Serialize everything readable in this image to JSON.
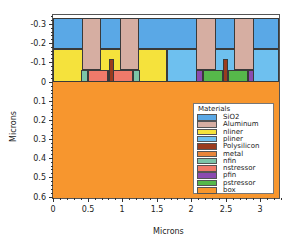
{
  "chart_data": {
    "type": "table",
    "title": "",
    "xlabel": "Microns",
    "ylabel": "Microns",
    "xlim": [
      0,
      3.27
    ],
    "ylim": [
      -0.35,
      0.6
    ],
    "y_inverted": true,
    "x_ticks": [
      "0",
      "0.5",
      "1",
      "1.5",
      "2",
      "2.5",
      "3"
    ],
    "y_ticks": [
      "-0.3",
      "-0.2",
      "-0.1",
      "0",
      "0.1",
      "0.2",
      "0.3",
      "0.4",
      "0.5",
      "0.6"
    ],
    "legend_title": "Materials",
    "legend_position": "lower right",
    "materials": [
      {
        "name": "SiO2",
        "color": "#5aa8e6"
      },
      {
        "name": "Aluminum",
        "color": "#d6aea2"
      },
      {
        "name": "nliner",
        "color": "#f5e23c"
      },
      {
        "name": "pliner",
        "color": "#6ec0ef"
      },
      {
        "name": "Polysilicon",
        "color": "#9a3b1e"
      },
      {
        "name": "metal",
        "color": "#e8853a"
      },
      {
        "name": "nfin",
        "color": "#7cc4a8"
      },
      {
        "name": "nstressor",
        "color": "#f07a6a"
      },
      {
        "name": "pfin",
        "color": "#8b4bb0"
      },
      {
        "name": "pstressor",
        "color": "#56b84a"
      },
      {
        "name": "box",
        "color": "#f7962e"
      }
    ],
    "regions": [
      {
        "material": "box",
        "x": [
          0,
          3.27
        ],
        "y": [
          0,
          0.6
        ]
      },
      {
        "material": "SiO2",
        "x": [
          0,
          3.27
        ],
        "y": [
          -0.33,
          -0.17
        ]
      },
      {
        "material": "nliner",
        "x": [
          0,
          1.65
        ],
        "y": [
          -0.17,
          0
        ]
      },
      {
        "material": "pliner",
        "x": [
          1.65,
          3.27
        ],
        "y": [
          -0.17,
          0
        ]
      },
      {
        "material": "Aluminum",
        "x": [
          0.42,
          0.7
        ],
        "y": [
          -0.33,
          -0.06
        ]
      },
      {
        "material": "Aluminum",
        "x": [
          0.97,
          1.25
        ],
        "y": [
          -0.33,
          -0.06
        ]
      },
      {
        "material": "nfin",
        "x": [
          0.41,
          0.51
        ],
        "y": [
          -0.06,
          0
        ]
      },
      {
        "material": "nstressor",
        "x": [
          0.51,
          0.8
        ],
        "y": [
          -0.06,
          0
        ]
      },
      {
        "material": "nfin",
        "x": [
          0.8,
          0.87
        ],
        "y": [
          -0.06,
          0
        ]
      },
      {
        "material": "Polysilicon",
        "x": [
          0.81,
          0.88
        ],
        "y": [
          -0.12,
          0
        ]
      },
      {
        "material": "nstressor",
        "x": [
          0.87,
          1.16
        ],
        "y": [
          -0.06,
          0
        ]
      },
      {
        "material": "nfin",
        "x": [
          1.16,
          1.26
        ],
        "y": [
          -0.06,
          0
        ]
      },
      {
        "material": "Aluminum",
        "x": [
          2.07,
          2.36
        ],
        "y": [
          -0.33,
          -0.06
        ]
      },
      {
        "material": "Aluminum",
        "x": [
          2.62,
          2.91
        ],
        "y": [
          -0.33,
          -0.06
        ]
      },
      {
        "material": "pfin",
        "x": [
          2.07,
          2.17
        ],
        "y": [
          -0.06,
          0
        ]
      },
      {
        "material": "pstressor",
        "x": [
          2.17,
          2.46
        ],
        "y": [
          -0.06,
          0
        ]
      },
      {
        "material": "pfin",
        "x": [
          2.46,
          2.53
        ],
        "y": [
          -0.06,
          0
        ]
      },
      {
        "material": "Polysilicon",
        "x": [
          2.46,
          2.53
        ],
        "y": [
          -0.12,
          0
        ]
      },
      {
        "material": "pstressor",
        "x": [
          2.53,
          2.82
        ],
        "y": [
          -0.06,
          0
        ]
      },
      {
        "material": "pfin",
        "x": [
          2.82,
          2.91
        ],
        "y": [
          -0.06,
          0
        ]
      }
    ]
  },
  "axes": {
    "x_title": "Microns",
    "y_title": "Microns",
    "x_ticks": [
      {
        "label": "0",
        "px": 53
      },
      {
        "label": "0.5",
        "px": 88
      },
      {
        "label": "1",
        "px": 122
      },
      {
        "label": "1.5",
        "px": 157
      },
      {
        "label": "2",
        "px": 191
      },
      {
        "label": "2.5",
        "px": 226
      },
      {
        "label": "3",
        "px": 260
      }
    ],
    "y_ticks": [
      {
        "label": "-0.3",
        "px": 24
      },
      {
        "label": "-0.2",
        "px": 43
      },
      {
        "label": "-0.1",
        "px": 62
      },
      {
        "label": "0",
        "px": 82
      },
      {
        "label": "0.1",
        "px": 101
      },
      {
        "label": "0.2",
        "px": 120
      },
      {
        "label": "0.3",
        "px": 139
      },
      {
        "label": "0.4",
        "px": 158
      },
      {
        "label": "0.5",
        "px": 177
      },
      {
        "label": "0.6",
        "px": 197
      }
    ]
  },
  "legend": {
    "title": "Materials",
    "items": [
      "SiO2",
      "Aluminum",
      "nliner",
      "pliner",
      "Polysilicon",
      "metal",
      "nfin",
      "nstressor",
      "pfin",
      "pstressor",
      "box"
    ]
  }
}
